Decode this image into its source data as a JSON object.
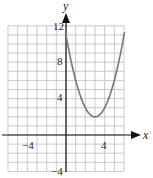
{
  "chart_data": {
    "type": "line",
    "title": "",
    "xlabel": "x",
    "ylabel": "y",
    "xlim": [
      -6,
      6
    ],
    "ylim": [
      -4,
      12
    ],
    "grid": true,
    "x_ticks_labeled": [
      "-4",
      "4"
    ],
    "y_ticks_labeled": [
      "-4",
      "4",
      "8",
      "12"
    ],
    "series": [
      {
        "name": "parabola",
        "equation": "y = (x - 3)^2 + 2",
        "x": [
          0,
          1,
          2,
          3,
          4,
          5,
          6
        ],
        "y": [
          11,
          6,
          3,
          2,
          3,
          6,
          11
        ]
      }
    ],
    "colors": {
      "curve": "#777777",
      "grid": "#bbbbbb",
      "axis": "#111111"
    }
  },
  "labels": {
    "x_axis": "x",
    "y_axis": "y",
    "x_neg4": "−4",
    "x_4": "4",
    "y_12": "12",
    "y_8": "8",
    "y_4": "4",
    "y_neg4": "−4"
  }
}
